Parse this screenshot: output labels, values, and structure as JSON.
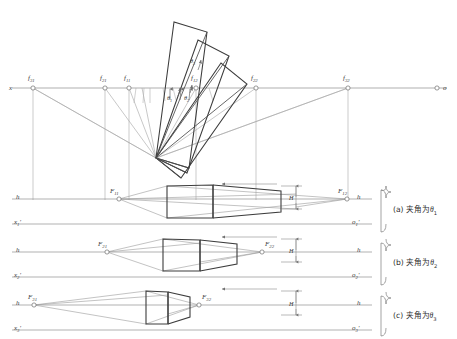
{
  "figure": {
    "kind": "two-point-perspective construction diagram",
    "top_axis": {
      "left_label": "x",
      "right_label": "o",
      "station_points": [
        {
          "name": "f31",
          "base": "f",
          "sub": "31",
          "x": 33,
          "y": 88
        },
        {
          "name": "f21",
          "base": "f",
          "sub": "21",
          "x": 105,
          "y": 88
        },
        {
          "name": "f11",
          "base": "f",
          "sub": "11",
          "x": 129,
          "y": 88
        },
        {
          "name": "f12",
          "base": "f",
          "sub": "12",
          "x": 196,
          "y": 88
        },
        {
          "name": "f22",
          "base": "f",
          "sub": "22",
          "x": 256,
          "y": 88
        },
        {
          "name": "f32",
          "base": "f",
          "sub": "32",
          "x": 348,
          "y": 88
        }
      ],
      "station_vertex": {
        "x": 156,
        "y": 158
      }
    },
    "angle_labels": [
      {
        "text": "θ1",
        "base": "θ",
        "sub": "1",
        "x": 169,
        "y": 92
      },
      {
        "text": "θ2",
        "base": "θ",
        "sub": "2",
        "x": 186,
        "y": 92
      },
      {
        "text": "θ3",
        "base": "θ",
        "sub": "3",
        "x": 192,
        "y": 62
      }
    ],
    "panels": [
      {
        "id": "a",
        "caption_prefix": "(a)",
        "caption_text": "夹角为",
        "caption_theta": "θ",
        "caption_sub": "1",
        "left_top_label": "h",
        "left_bottom_label": "x1'",
        "left_bottom_base": "x",
        "left_bottom_sub": "1",
        "right_top_label": "h",
        "right_bottom_label": "o1'",
        "right_bottom_base": "o",
        "right_bottom_sub": "1",
        "vp_left": {
          "name": "F11",
          "base": "F",
          "sub": "11",
          "x": 119,
          "y": 199
        },
        "vp_right": {
          "name": "F12",
          "base": "F",
          "sub": "12",
          "x": 347,
          "y": 199
        },
        "height_label": "H",
        "horizon_y": 199,
        "ground_y": 224
      },
      {
        "id": "b",
        "caption_prefix": "(b)",
        "caption_text": "夹角为",
        "caption_theta": "θ",
        "caption_sub": "2",
        "left_top_label": "h",
        "left_bottom_label": "x2'",
        "left_bottom_base": "x",
        "left_bottom_sub": "2",
        "right_top_label": "h",
        "right_bottom_label": "o2'",
        "right_bottom_base": "o",
        "right_bottom_sub": "2",
        "vp_left": {
          "name": "F21",
          "base": "F",
          "sub": "21",
          "x": 107,
          "y": 252
        },
        "vp_right": {
          "name": "F22",
          "base": "F",
          "sub": "22",
          "x": 262,
          "y": 252
        },
        "height_label": "H",
        "horizon_y": 252,
        "ground_y": 277
      },
      {
        "id": "c",
        "caption_prefix": "(c)",
        "caption_text": "夹角为",
        "caption_theta": "θ",
        "caption_sub": "3",
        "left_top_label": "h",
        "left_bottom_label": "x3'",
        "left_bottom_base": "x",
        "left_bottom_sub": "3",
        "right_top_label": "h",
        "right_bottom_label": "o3'",
        "right_bottom_base": "o",
        "right_bottom_sub": "3",
        "vp_left": {
          "name": "F31",
          "base": "F",
          "sub": "31",
          "x": 34,
          "y": 305
        },
        "vp_right": {
          "name": "F32",
          "base": "F",
          "sub": "32",
          "x": 199,
          "y": 305
        },
        "height_label": "H",
        "horizon_y": 305,
        "ground_y": 330
      }
    ],
    "colors": {
      "construction_line": "#9a9a9a",
      "object_outline": "#3c3c3c",
      "plan_outline": "#333333",
      "text": "#333333",
      "axis": "#8c8c8c"
    }
  }
}
